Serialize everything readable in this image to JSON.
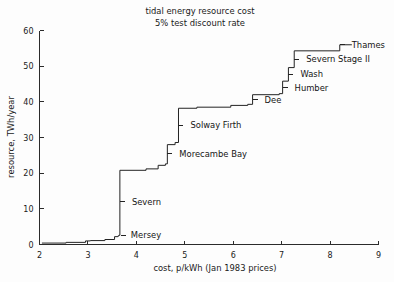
{
  "figure": {
    "title_line1": "tidal energy resource cost",
    "title_line2": "5% test discount rate",
    "background_color": "#fdfdfd",
    "line_color": "#232323",
    "axis_color": "#2b2b2b"
  },
  "chart_data": {
    "type": "line",
    "subtitle": "5% test discount rate",
    "xlabel": "cost, p/kWh  (Jan 1983 prices)",
    "ylabel": "resource, TWh/year",
    "xlim": [
      2,
      9
    ],
    "ylim": [
      0,
      60
    ],
    "xticks": [
      2,
      3,
      4,
      5,
      6,
      7,
      8,
      9
    ],
    "yticks": [
      0,
      10,
      20,
      30,
      40,
      50,
      60
    ],
    "xtick_labels": [
      "2",
      "3",
      "4",
      "5",
      "6",
      "7",
      "8",
      "9"
    ],
    "ytick_labels": [
      "0",
      "10",
      "20",
      "30",
      "40",
      "50",
      "60"
    ],
    "grid": false,
    "legend": "none",
    "series": [
      {
        "name": "cumulative tidal resource (step curve)",
        "x": [
          2.05,
          2.55,
          2.55,
          2.95,
          2.95,
          3.05,
          3.05,
          3.35,
          3.35,
          3.55,
          3.55,
          3.62,
          3.62,
          3.64,
          3.64,
          3.66,
          3.66,
          4.2,
          4.2,
          4.45,
          4.45,
          4.6,
          4.6,
          4.64,
          4.64,
          4.8,
          4.8,
          4.87,
          4.87,
          5.25,
          5.25,
          5.95,
          5.95,
          6.3,
          6.3,
          6.4,
          6.4,
          6.95,
          6.95,
          7.02,
          7.02,
          7.14,
          7.14,
          7.26,
          7.26,
          8.2,
          8.2,
          8.45
        ],
        "y": [
          0.4,
          0.4,
          0.6,
          0.6,
          1.0,
          1.0,
          1.1,
          1.1,
          1.4,
          1.4,
          2.2,
          2.2,
          2.4,
          2.4,
          2.6,
          2.6,
          20.8,
          20.8,
          21.2,
          21.2,
          22.2,
          22.2,
          22.6,
          22.6,
          28.0,
          28.0,
          28.6,
          28.6,
          38.2,
          38.2,
          38.5,
          38.5,
          39.0,
          39.0,
          39.3,
          39.3,
          42.0,
          42.0,
          42.3,
          42.3,
          45.8,
          45.8,
          49.6,
          49.6,
          54.3,
          54.3,
          56.0,
          56.0
        ]
      }
    ],
    "annotations": [
      {
        "label": "Mersey",
        "x": 3.68,
        "y": 2.6,
        "tip_x": 3.68,
        "tip_y": 2.6,
        "dx": 10,
        "dy": 0
      },
      {
        "label": "Severn",
        "x": 3.7,
        "y": 12.0,
        "tip_x": 3.66,
        "tip_y": 12.0,
        "dx": 12,
        "dy": 0
      },
      {
        "label": "Morecambe Bay",
        "x": 4.7,
        "y": 25.4,
        "tip_x": 4.64,
        "tip_y": 25.4,
        "dx": 12,
        "dy": 0
      },
      {
        "label": "Solway Firth",
        "x": 4.92,
        "y": 33.5,
        "tip_x": 4.87,
        "tip_y": 33.5,
        "dx": 12,
        "dy": 0
      },
      {
        "label": "Dee",
        "x": 6.48,
        "y": 40.6,
        "tip_x": 6.4,
        "tip_y": 40.6,
        "dx": 12,
        "dy": 0
      },
      {
        "label": "Humber",
        "x": 7.1,
        "y": 44.0,
        "tip_x": 7.02,
        "tip_y": 44.0,
        "dx": 12,
        "dy": 0
      },
      {
        "label": "Wash",
        "x": 7.24,
        "y": 47.8,
        "tip_x": 7.14,
        "tip_y": 47.8,
        "dx": 12,
        "dy": 0
      },
      {
        "label": "Severn Stage II",
        "x": 7.36,
        "y": 52.0,
        "tip_x": 7.26,
        "tip_y": 52.0,
        "dx": 12,
        "dy": 0
      },
      {
        "label": "Thames",
        "x": 8.3,
        "y": 56.0,
        "tip_x": 8.2,
        "tip_y": 56.0,
        "dx": 12,
        "dy": 0
      }
    ]
  }
}
